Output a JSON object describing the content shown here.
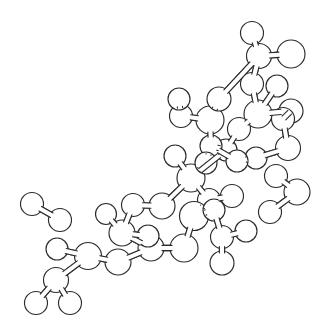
{
  "figure": {
    "kind": "molecular-structure-diagram",
    "width": 324,
    "height": 324,
    "background_color": "#ffffff",
    "stroke_color": "#2b2b2b",
    "atom_fill_color": "#ffffff",
    "line_width": 1.15,
    "style": "line-art, unlabeled, monochrome, hand-drawn appearance",
    "atom_count": 46,
    "bond_count": 47,
    "fragment_count": 4
  },
  "structure": {
    "atoms": [
      {
        "id": "a1",
        "name": "atom-a1",
        "x": 252,
        "y": 33,
        "r": 11.5
      },
      {
        "id": "a2",
        "name": "atom-a2",
        "x": 259,
        "y": 56,
        "r": 12.5
      },
      {
        "id": "a3",
        "name": "atom-a3",
        "x": 291,
        "y": 54,
        "r": 14.0
      },
      {
        "id": "a4",
        "name": "atom-a4",
        "x": 252,
        "y": 84,
        "r": 11.5
      },
      {
        "id": "a5",
        "name": "atom-a5",
        "x": 258,
        "y": 114,
        "r": 14.0
      },
      {
        "id": "a6",
        "name": "atom-a6",
        "x": 277,
        "y": 86,
        "r": 11.0
      },
      {
        "id": "a7",
        "name": "atom-a7",
        "x": 291,
        "y": 111,
        "r": 12.0
      },
      {
        "id": "a8",
        "name": "atom-a8",
        "x": 288,
        "y": 148,
        "r": 12.5
      },
      {
        "id": "a9",
        "name": "atom-a9",
        "x": 256,
        "y": 158,
        "r": 11.0
      },
      {
        "id": "a10",
        "name": "atom-a10",
        "x": 239,
        "y": 129,
        "r": 11.5
      },
      {
        "id": "a11",
        "name": "atom-a11",
        "x": 226,
        "y": 150,
        "r": 11.0
      },
      {
        "id": "a12",
        "name": "atom-a12",
        "x": 210,
        "y": 120,
        "r": 14.0
      },
      {
        "id": "a13",
        "name": "atom-a13",
        "x": 219,
        "y": 99,
        "r": 12.0
      },
      {
        "id": "a14",
        "name": "atom-a14",
        "x": 181,
        "y": 116,
        "r": 11.5
      },
      {
        "id": "a15",
        "name": "atom-a15",
        "x": 211,
        "y": 146,
        "r": 11.0
      },
      {
        "id": "a16",
        "name": "atom-a16",
        "x": 191,
        "y": 178,
        "r": 14.0
      },
      {
        "id": "a17",
        "name": "atom-a17",
        "x": 175,
        "y": 156,
        "r": 11.0
      },
      {
        "id": "a18",
        "name": "atom-a18",
        "x": 206,
        "y": 163,
        "r": 11.0
      },
      {
        "id": "a19",
        "name": "atom-a19",
        "x": 209,
        "y": 200,
        "r": 11.5
      },
      {
        "id": "a20",
        "name": "atom-a20",
        "x": 194,
        "y": 216,
        "r": 14.5
      },
      {
        "id": "a21",
        "name": "atom-a21",
        "x": 232,
        "y": 196,
        "r": 11.5
      },
      {
        "id": "a22",
        "name": "atom-a22",
        "x": 184,
        "y": 248,
        "r": 14.0
      },
      {
        "id": "a23",
        "name": "atom-a23",
        "x": 222,
        "y": 237,
        "r": 11.5
      },
      {
        "id": "a24",
        "name": "atom-a24",
        "x": 246,
        "y": 231,
        "r": 11.0
      },
      {
        "id": "a25",
        "name": "atom-a25",
        "x": 222,
        "y": 263,
        "r": 12.0
      },
      {
        "id": "a26",
        "name": "atom-a26",
        "x": 162,
        "y": 206,
        "r": 13.0
      },
      {
        "id": "a27",
        "name": "atom-a27",
        "x": 133,
        "y": 205,
        "r": 11.5
      },
      {
        "id": "a28",
        "name": "atom-a28",
        "x": 122,
        "y": 233,
        "r": 13.0
      },
      {
        "id": "a29",
        "name": "atom-a29",
        "x": 106,
        "y": 214,
        "r": 10.5
      },
      {
        "id": "a30",
        "name": "atom-a30",
        "x": 151,
        "y": 248,
        "r": 13.0
      },
      {
        "id": "a31",
        "name": "atom-a31",
        "x": 118,
        "y": 262,
        "r": 13.0
      },
      {
        "id": "a32",
        "name": "atom-a32",
        "x": 88,
        "y": 256,
        "r": 13.5
      },
      {
        "id": "a33",
        "name": "atom-a33",
        "x": 57,
        "y": 249,
        "r": 11.0
      },
      {
        "id": "a34",
        "name": "atom-a34",
        "x": 56,
        "y": 280,
        "r": 12.5
      },
      {
        "id": "a35",
        "name": "atom-a35",
        "x": 36,
        "y": 303,
        "r": 11.5
      },
      {
        "id": "a36",
        "name": "atom-a36",
        "x": 70,
        "y": 303,
        "r": 11.5
      },
      {
        "id": "a37",
        "name": "atom-a37",
        "x": 32,
        "y": 204,
        "r": 11.5
      },
      {
        "id": "a38",
        "name": "atom-a38",
        "x": 60,
        "y": 220,
        "r": 11.5
      },
      {
        "id": "a39",
        "name": "atom-a39",
        "x": 276,
        "y": 176,
        "r": 11.5
      },
      {
        "id": "a40",
        "name": "atom-a40",
        "x": 297,
        "y": 192,
        "r": 13.0
      },
      {
        "id": "a41",
        "name": "atom-a41",
        "x": 270,
        "y": 212,
        "r": 11.5
      },
      {
        "id": "a42",
        "name": "atom-a42",
        "x": 179,
        "y": 99,
        "r": 11.0
      },
      {
        "id": "a43",
        "name": "atom-a43",
        "x": 237,
        "y": 161,
        "r": 11.0
      },
      {
        "id": "a44",
        "name": "atom-a44",
        "x": 148,
        "y": 236,
        "r": 11.0
      },
      {
        "id": "a45",
        "name": "atom-a45",
        "x": 283,
        "y": 119,
        "r": 11.5
      },
      {
        "id": "a46",
        "name": "atom-a46",
        "x": 214,
        "y": 210,
        "r": 11.0
      }
    ],
    "bonds": [
      {
        "from": "a1",
        "to": "a2"
      },
      {
        "from": "a2",
        "to": "a3"
      },
      {
        "from": "a2",
        "to": "a4"
      },
      {
        "from": "a4",
        "to": "a5"
      },
      {
        "from": "a5",
        "to": "a6"
      },
      {
        "from": "a5",
        "to": "a7"
      },
      {
        "from": "a7",
        "to": "a45"
      },
      {
        "from": "a45",
        "to": "a8"
      },
      {
        "from": "a8",
        "to": "a9"
      },
      {
        "from": "a5",
        "to": "a10"
      },
      {
        "from": "a10",
        "to": "a11"
      },
      {
        "from": "a12",
        "to": "a13"
      },
      {
        "from": "a12",
        "to": "a14"
      },
      {
        "from": "a12",
        "to": "a15"
      },
      {
        "from": "a15",
        "to": "a11"
      },
      {
        "from": "a15",
        "to": "a43"
      },
      {
        "from": "a14",
        "to": "a42"
      },
      {
        "from": "a16",
        "to": "a17"
      },
      {
        "from": "a16",
        "to": "a18"
      },
      {
        "from": "a18",
        "to": "a15"
      },
      {
        "from": "a16",
        "to": "a19"
      },
      {
        "from": "a19",
        "to": "a20"
      },
      {
        "from": "a19",
        "to": "a21"
      },
      {
        "from": "a16",
        "to": "a26"
      },
      {
        "from": "a20",
        "to": "a22"
      },
      {
        "from": "a20",
        "to": "a46"
      },
      {
        "from": "a46",
        "to": "a23"
      },
      {
        "from": "a23",
        "to": "a24"
      },
      {
        "from": "a23",
        "to": "a25"
      },
      {
        "from": "a26",
        "to": "a27"
      },
      {
        "from": "a27",
        "to": "a28"
      },
      {
        "from": "a28",
        "to": "a29"
      },
      {
        "from": "a28",
        "to": "a30"
      },
      {
        "from": "a28",
        "to": "a44"
      },
      {
        "from": "a30",
        "to": "a31"
      },
      {
        "from": "a31",
        "to": "a32"
      },
      {
        "from": "a32",
        "to": "a33"
      },
      {
        "from": "a32",
        "to": "a34"
      },
      {
        "from": "a34",
        "to": "a35"
      },
      {
        "from": "a34",
        "to": "a36"
      },
      {
        "from": "a37",
        "to": "a38"
      },
      {
        "from": "a39",
        "to": "a40"
      },
      {
        "from": "a40",
        "to": "a41"
      },
      {
        "from": "a11",
        "to": "a16"
      },
      {
        "from": "a9",
        "to": "a43"
      },
      {
        "from": "a13",
        "to": "a2"
      },
      {
        "from": "a22",
        "to": "a30"
      }
    ],
    "fragments": [
      {
        "name": "main-chain",
        "atom_ids": [
          "a1",
          "a2",
          "a3",
          "a4",
          "a5",
          "a6",
          "a7",
          "a8",
          "a9",
          "a10",
          "a11",
          "a12",
          "a13",
          "a14",
          "a15",
          "a16",
          "a17",
          "a18",
          "a19",
          "a20",
          "a21",
          "a22",
          "a23",
          "a24",
          "a25",
          "a26",
          "a27",
          "a28",
          "a29",
          "a30",
          "a31",
          "a32",
          "a33",
          "a34",
          "a35",
          "a36",
          "a42",
          "a43",
          "a44",
          "a45",
          "a46"
        ]
      },
      {
        "name": "detached-pair-left",
        "atom_ids": [
          "a37",
          "a38"
        ]
      },
      {
        "name": "detached-trio-right",
        "atom_ids": [
          "a39",
          "a40",
          "a41"
        ]
      }
    ]
  }
}
